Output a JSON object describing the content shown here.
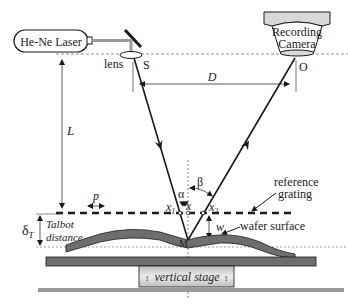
{
  "diagram": {
    "type": "optical-setup",
    "components": {
      "laser": {
        "label": "He-Ne Laser"
      },
      "camera": {
        "label_line1": "Recording",
        "label_line2": "Camera"
      },
      "lens": {
        "label": "lens"
      },
      "source_point": {
        "label": "S"
      },
      "observer_point": {
        "label": "O"
      },
      "reference_grating": {
        "label_line1": "reference",
        "label_line2": "grating"
      },
      "wafer": {
        "label": "wafer surface"
      },
      "stage": {
        "label": "vertical stage"
      },
      "mirror_point": {
        "label": "M"
      }
    },
    "dimensions": {
      "distance_D": "D",
      "distance_L": "L",
      "pitch": "p",
      "deflection": "w",
      "talbot_symbol": "δT",
      "talbot_symbol_main": "δ",
      "talbot_symbol_sub": "T",
      "talbot_label_line1": "Talbot",
      "talbot_label_line2": "distance"
    },
    "angles": {
      "incidence": "α",
      "reflection": "β"
    },
    "points": {
      "x1_main": "x",
      "x1_sub": "1",
      "x": "x",
      "x2_main": "x",
      "x2_sub": "2"
    },
    "colors": {
      "line": "#1a1a1a",
      "wafer_fill": "#6e6e6e",
      "stage_fill": "#d6d6d6",
      "base_fill": "#9a9a9a",
      "laser_beam": "#9a9a9a"
    }
  }
}
